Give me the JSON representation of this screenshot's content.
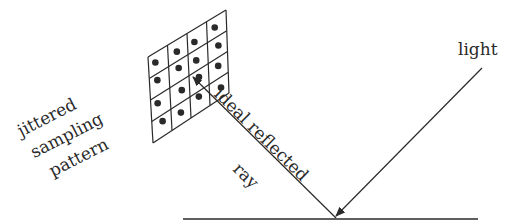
{
  "labels": {
    "light": "light",
    "ray_line1": "ideal reflected",
    "ray_line2": "ray",
    "pattern_line1": "jittered",
    "pattern_line2": "sampling",
    "pattern_line3": "pattern"
  },
  "grid": {
    "rows": 4,
    "cols": 4,
    "samples": [
      [
        0.35,
        0.45
      ],
      [
        1.45,
        0.55
      ],
      [
        2.35,
        0.6
      ],
      [
        3.4,
        0.5
      ],
      [
        0.4,
        1.3
      ],
      [
        1.5,
        1.35
      ],
      [
        2.4,
        1.5
      ],
      [
        3.55,
        1.45
      ],
      [
        0.35,
        2.35
      ],
      [
        1.6,
        2.45
      ],
      [
        2.5,
        2.35
      ],
      [
        3.5,
        2.4
      ],
      [
        0.55,
        3.3
      ],
      [
        1.5,
        3.45
      ],
      [
        2.45,
        3.25
      ],
      [
        3.6,
        3.5
      ]
    ]
  },
  "colors": {
    "ink": "#2a2a2a",
    "background": "#ffffff"
  }
}
